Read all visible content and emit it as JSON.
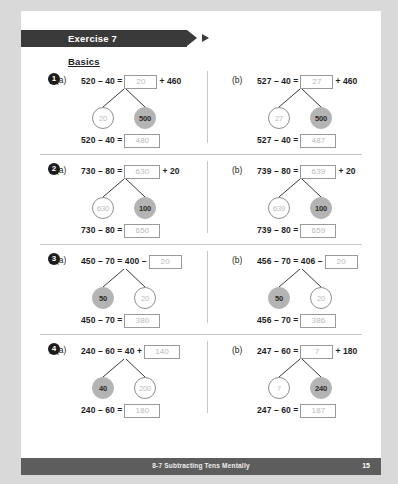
{
  "banner": {
    "label": "Exercise 7"
  },
  "section_heading": "Basics",
  "footer": {
    "title": "8-7  Subtracting Tens Mentally",
    "page_number": "15"
  },
  "colors": {
    "banner_bg": "#3a3a3a",
    "footer_bg": "#5d5d5d",
    "page_bg": "#ffffff",
    "outer_bg": "#d9d9d9",
    "filled_circle": "#b4b4b4",
    "answer_text": "#b9b9b9",
    "box_border": "#9a9a9a"
  },
  "problems": [
    {
      "number": "1",
      "parts": [
        {
          "letter": "(a)",
          "top_prefix": "520 – 40 =",
          "top_answer": "20",
          "top_suffix": "+ 460",
          "bond_left": {
            "value": "20",
            "style": "open"
          },
          "bond_right": {
            "value": "500",
            "style": "filled"
          },
          "bottom_prefix": "520 – 40 =",
          "bottom_answer": "480"
        },
        {
          "letter": "(b)",
          "top_prefix": "527 – 40 =",
          "top_answer": "27",
          "top_suffix": "+ 460",
          "bond_left": {
            "value": "27",
            "style": "open"
          },
          "bond_right": {
            "value": "500",
            "style": "filled"
          },
          "bottom_prefix": "527 – 40 =",
          "bottom_answer": "487"
        }
      ]
    },
    {
      "number": "2",
      "parts": [
        {
          "letter": "(a)",
          "top_prefix": "730 – 80 =",
          "top_answer": "630",
          "top_suffix": "+ 20",
          "bond_left": {
            "value": "630",
            "style": "open"
          },
          "bond_right": {
            "value": "100",
            "style": "filled"
          },
          "bottom_prefix": "730 – 80 =",
          "bottom_answer": "650"
        },
        {
          "letter": "(b)",
          "top_prefix": "739 – 80 =",
          "top_answer": "639",
          "top_suffix": "+ 20",
          "bond_left": {
            "value": "639",
            "style": "open"
          },
          "bond_right": {
            "value": "100",
            "style": "filled"
          },
          "bottom_prefix": "739 – 80 =",
          "bottom_answer": "659"
        }
      ]
    },
    {
      "number": "3",
      "parts": [
        {
          "letter": "(a)",
          "top_prefix": "450 – 70 = 400 –",
          "top_answer": "20",
          "top_suffix": "",
          "bond_left": {
            "value": "50",
            "style": "filled"
          },
          "bond_right": {
            "value": "20",
            "style": "open"
          },
          "bottom_prefix": "450 – 70 =",
          "bottom_answer": "380"
        },
        {
          "letter": "(b)",
          "top_prefix": "456 – 70 = 406 –",
          "top_answer": "20",
          "top_suffix": "",
          "bond_left": {
            "value": "50",
            "style": "filled"
          },
          "bond_right": {
            "value": "20",
            "style": "open"
          },
          "bottom_prefix": "456 – 70 =",
          "bottom_answer": "386"
        }
      ]
    },
    {
      "number": "4",
      "parts": [
        {
          "letter": "(a)",
          "top_prefix": "240 – 60 = 40 +",
          "top_answer": "140",
          "top_suffix": "",
          "bond_left": {
            "value": "40",
            "style": "filled"
          },
          "bond_right": {
            "value": "200",
            "style": "open"
          },
          "bottom_prefix": "240 – 60 =",
          "bottom_answer": "180"
        },
        {
          "letter": "(b)",
          "top_prefix": "247 – 60 =",
          "top_answer": "7",
          "top_suffix": "+ 180",
          "bond_left": {
            "value": "7",
            "style": "open"
          },
          "bond_right": {
            "value": "240",
            "style": "filled"
          },
          "bottom_prefix": "247 – 60 =",
          "bottom_answer": "187"
        }
      ]
    }
  ]
}
